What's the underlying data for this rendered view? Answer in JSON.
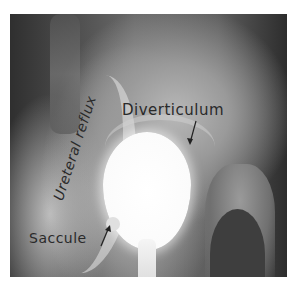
{
  "figure": {
    "type": "radiograph",
    "annotations": {
      "diverticulum": "Diverticulum",
      "saccule": "Saccule",
      "ureteral_reflux": "Ureteral reflux"
    },
    "colors": {
      "background": "#ffffff",
      "film_dark": "#3a3a3a",
      "contrast_bright": "#ffffff",
      "label_ink": "#2a2a2a"
    }
  }
}
